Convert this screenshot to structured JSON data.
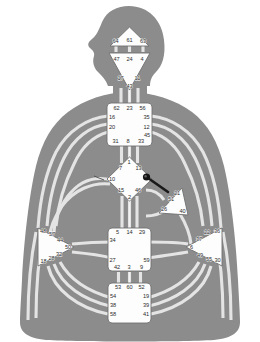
{
  "figure": {
    "caption": "",
    "colors": {
      "body_fill": "#8c8c8c",
      "body_stroke": "#7a7a7a",
      "channel_fill": "#e6e6e6",
      "channel_stroke": "#c9c9c9",
      "center_fill": "#fdfdfd",
      "center_stroke": "#6f6f6f",
      "label_color": "#2b2b2b",
      "background": "#ffffff",
      "pointer_color": "#1a1a1a"
    }
  },
  "centers": [
    {
      "id": "head",
      "name": "Head Center",
      "shape": "triangle-up",
      "gates": [
        {
          "num": "64",
          "x": 115.5,
          "y": 41.5
        },
        {
          "num": "61",
          "x": 129.5,
          "y": 41.0
        },
        {
          "num": "63",
          "x": 143.0,
          "y": 41.5
        }
      ]
    },
    {
      "id": "ajna",
      "name": "Ajna Center",
      "shape": "triangle-down",
      "gates": [
        {
          "num": "47",
          "x": 116.5,
          "y": 59.5
        },
        {
          "num": "24",
          "x": 129.5,
          "y": 59.5
        },
        {
          "num": "4",
          "x": 142.0,
          "y": 59.5
        },
        {
          "num": "17",
          "x": 120.5,
          "y": 78.5
        },
        {
          "num": "11",
          "x": 137.5,
          "y": 78.5
        },
        {
          "num": "43",
          "x": 129.5,
          "y": 86.5
        }
      ]
    },
    {
      "id": "throat",
      "name": "Throat Center",
      "shape": "square",
      "gates": [
        {
          "num": "62",
          "x": 116.5,
          "y": 108.5
        },
        {
          "num": "23",
          "x": 129.5,
          "y": 108.5
        },
        {
          "num": "56",
          "x": 142.5,
          "y": 108.5
        },
        {
          "num": "16",
          "x": 112.0,
          "y": 118.0
        },
        {
          "num": "35",
          "x": 146.5,
          "y": 118.0
        },
        {
          "num": "20",
          "x": 112.0,
          "y": 128.0
        },
        {
          "num": "12",
          "x": 146.5,
          "y": 127.5
        },
        {
          "num": "45",
          "x": 147.0,
          "y": 135.5
        },
        {
          "num": "31",
          "x": 115.5,
          "y": 142.0
        },
        {
          "num": "8",
          "x": 128.0,
          "y": 142.0
        },
        {
          "num": "33",
          "x": 141.0,
          "y": 142.0
        }
      ]
    },
    {
      "id": "g",
      "name": "G Center / Identity",
      "shape": "diamond",
      "gates": [
        {
          "num": "1",
          "x": 129.0,
          "y": 162.5
        },
        {
          "num": "7",
          "x": 120.5,
          "y": 168.5
        },
        {
          "num": "13",
          "x": 138.5,
          "y": 168.5
        },
        {
          "num": "10",
          "x": 112.0,
          "y": 179.5
        },
        {
          "num": "15",
          "x": 121.0,
          "y": 191.0
        },
        {
          "num": "46",
          "x": 138.0,
          "y": 191.0
        },
        {
          "num": "2",
          "x": 129.5,
          "y": 197.5
        }
      ]
    },
    {
      "id": "heart",
      "name": "Heart / Ego Center",
      "shape": "triangle-right",
      "gates": [
        {
          "num": "21",
          "x": 177.0,
          "y": 193.5
        },
        {
          "num": "51",
          "x": 171.0,
          "y": 200.0
        },
        {
          "num": "26",
          "x": 164.0,
          "y": 210.0
        },
        {
          "num": "40",
          "x": 182.5,
          "y": 211.5
        }
      ]
    },
    {
      "id": "spleen",
      "name": "Spleen Center",
      "shape": "triangle-left",
      "gates": [
        {
          "num": "48",
          "x": 43.0,
          "y": 232.0
        },
        {
          "num": "57",
          "x": 52.0,
          "y": 234.5
        },
        {
          "num": "44",
          "x": 60.0,
          "y": 241.0
        },
        {
          "num": "50",
          "x": 68.0,
          "y": 248.0
        },
        {
          "num": "32",
          "x": 59.0,
          "y": 255.0
        },
        {
          "num": "28",
          "x": 51.5,
          "y": 258.5
        },
        {
          "num": "18",
          "x": 43.5,
          "y": 262.0
        }
      ]
    },
    {
      "id": "sacral",
      "name": "Sacral Center",
      "shape": "square",
      "gates": [
        {
          "num": "5",
          "x": 117.5,
          "y": 233.0
        },
        {
          "num": "14",
          "x": 129.5,
          "y": 233.0
        },
        {
          "num": "29",
          "x": 142.0,
          "y": 233.0
        },
        {
          "num": "34",
          "x": 112.5,
          "y": 240.5
        },
        {
          "num": "27",
          "x": 112.5,
          "y": 261.0
        },
        {
          "num": "59",
          "x": 146.5,
          "y": 261.0
        },
        {
          "num": "42",
          "x": 117.0,
          "y": 267.5
        },
        {
          "num": "3",
          "x": 129.0,
          "y": 267.5
        },
        {
          "num": "9",
          "x": 141.5,
          "y": 267.5
        }
      ]
    },
    {
      "id": "solar_plexus",
      "name": "Solar Plexus Center",
      "shape": "triangle-right",
      "gates": [
        {
          "num": "22",
          "x": 207.0,
          "y": 233.0
        },
        {
          "num": "36",
          "x": 217.0,
          "y": 231.5
        },
        {
          "num": "37",
          "x": 199.0,
          "y": 240.0
        },
        {
          "num": "6",
          "x": 191.5,
          "y": 248.0
        },
        {
          "num": "49",
          "x": 200.0,
          "y": 255.5
        },
        {
          "num": "55",
          "x": 209.0,
          "y": 259.5
        },
        {
          "num": "30",
          "x": 217.5,
          "y": 261.0
        }
      ]
    },
    {
      "id": "root",
      "name": "Root Center",
      "shape": "square",
      "gates": [
        {
          "num": "53",
          "x": 118.0,
          "y": 287.5
        },
        {
          "num": "60",
          "x": 129.5,
          "y": 287.5
        },
        {
          "num": "52",
          "x": 141.5,
          "y": 287.5
        },
        {
          "num": "54",
          "x": 113.0,
          "y": 296.5
        },
        {
          "num": "19",
          "x": 146.0,
          "y": 296.5
        },
        {
          "num": "38",
          "x": 113.0,
          "y": 306.0
        },
        {
          "num": "39",
          "x": 146.0,
          "y": 306.0
        },
        {
          "num": "58",
          "x": 113.0,
          "y": 315.0
        },
        {
          "num": "41",
          "x": 146.0,
          "y": 315.0
        }
      ]
    }
  ],
  "pointer": {
    "name": "pointer-pin",
    "visible": true
  }
}
